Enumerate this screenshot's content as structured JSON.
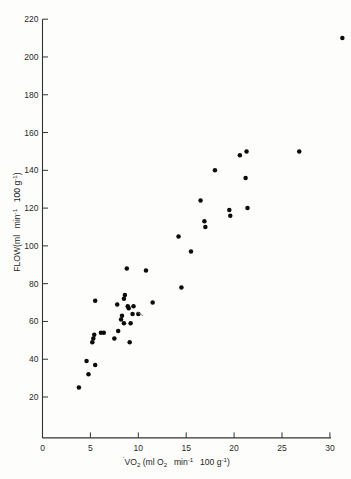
{
  "chart_data": {
    "type": "scatter",
    "title": "",
    "xlabel": "VO2 (ml O2  min-1  100 g-1)",
    "ylabel": "FLOW(ml  min-1  100 g-1)",
    "xlabel_parts": {
      "v_dot": "V",
      "o_main": "O",
      "o_sub": "2",
      "open_paren": " (ml O",
      "o2_sub": "2",
      "min": "  min",
      "min_sup": "-1",
      "hundred": "  100 g",
      "g_sup": "-1",
      "close_paren": ")"
    },
    "ylabel_parts": {
      "flow": "FLOW(ml  min",
      "min_sup": "-1",
      "hundred": "  100 g",
      "g_sup": "-1",
      "close_paren": ")"
    },
    "xlim": [
      0,
      31.5
    ],
    "ylim": [
      10,
      220
    ],
    "xticks": [
      0,
      5,
      10,
      15,
      20,
      25,
      30
    ],
    "yticks": [
      20,
      40,
      60,
      80,
      100,
      120,
      140,
      160,
      180,
      200,
      220
    ],
    "xtick_labels": [
      "0",
      "5",
      "10",
      "15",
      "20",
      "25",
      "30"
    ],
    "ytick_labels": [
      "20",
      "40",
      "60",
      "80",
      "100",
      "120",
      "140",
      "160",
      "180",
      "200",
      "220"
    ],
    "grid": false,
    "legend": null,
    "marker_color": "#0b0b0b",
    "axis_color": "#333333",
    "points": [
      {
        "x": 3.8,
        "y": 25
      },
      {
        "x": 4.6,
        "y": 39
      },
      {
        "x": 4.8,
        "y": 32
      },
      {
        "x": 5.5,
        "y": 37
      },
      {
        "x": 5.2,
        "y": 49
      },
      {
        "x": 5.3,
        "y": 51
      },
      {
        "x": 5.4,
        "y": 53
      },
      {
        "x": 5.5,
        "y": 71
      },
      {
        "x": 6.1,
        "y": 54
      },
      {
        "x": 6.4,
        "y": 54
      },
      {
        "x": 7.5,
        "y": 51
      },
      {
        "x": 7.9,
        "y": 55
      },
      {
        "x": 7.8,
        "y": 69
      },
      {
        "x": 8.2,
        "y": 61
      },
      {
        "x": 8.3,
        "y": 63
      },
      {
        "x": 8.5,
        "y": 72
      },
      {
        "x": 8.6,
        "y": 74
      },
      {
        "x": 8.5,
        "y": 59
      },
      {
        "x": 8.8,
        "y": 88
      },
      {
        "x": 8.9,
        "y": 68
      },
      {
        "x": 9.0,
        "y": 67
      },
      {
        "x": 9.2,
        "y": 59
      },
      {
        "x": 9.1,
        "y": 49
      },
      {
        "x": 9.4,
        "y": 64
      },
      {
        "x": 9.5,
        "y": 68
      },
      {
        "x": 10.0,
        "y": 64
      },
      {
        "x": 10.8,
        "y": 87
      },
      {
        "x": 11.5,
        "y": 70
      },
      {
        "x": 14.2,
        "y": 105
      },
      {
        "x": 14.5,
        "y": 78
      },
      {
        "x": 15.5,
        "y": 97
      },
      {
        "x": 16.5,
        "y": 124
      },
      {
        "x": 16.9,
        "y": 113
      },
      {
        "x": 17.0,
        "y": 110
      },
      {
        "x": 18.0,
        "y": 140
      },
      {
        "x": 19.5,
        "y": 119
      },
      {
        "x": 19.6,
        "y": 116
      },
      {
        "x": 20.6,
        "y": 148
      },
      {
        "x": 21.2,
        "y": 136
      },
      {
        "x": 21.3,
        "y": 150
      },
      {
        "x": 21.4,
        "y": 120
      },
      {
        "x": 26.8,
        "y": 150
      },
      {
        "x": 31.3,
        "y": 210
      }
    ],
    "artifact_marks": [
      {
        "x1": 9.9,
        "y1": 65,
        "x2": 10.5,
        "y2": 63
      }
    ]
  }
}
